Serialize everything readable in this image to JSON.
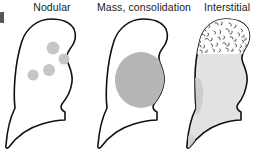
{
  "figure": {
    "name": "radiographic-lung-patterns",
    "background_color": "#ffffff",
    "outline_color": "#111111",
    "panel_count": 3
  },
  "panels": [
    {
      "id": "nodular",
      "label": "Nodular",
      "pattern": "nodular",
      "fill_color": "#ffffff",
      "lesion_color": "#c6c6c6",
      "description_icon": "lung-outline-icon",
      "lesions": [
        {
          "cx": 49,
          "cy": 34,
          "r": 6.5
        },
        {
          "cx": 60,
          "cy": 45,
          "r": 5.5
        },
        {
          "cx": 45,
          "cy": 56,
          "r": 6.0
        },
        {
          "cx": 29,
          "cy": 61,
          "r": 5.5
        }
      ]
    },
    {
      "id": "mass",
      "label": "Mass, consolidation",
      "pattern": "mass-consolidation",
      "fill_color": "#ffffff",
      "lesion_color": "#b6b6b6",
      "description_icon": "lung-outline-icon",
      "lesions": [
        {
          "cx": 45,
          "cy": 66,
          "rx": 26,
          "ry": 28
        }
      ]
    },
    {
      "id": "interstitial",
      "label": "Interstitial",
      "pattern": "interstitial",
      "fill_color": "#e2e2e2",
      "lesion_color": "#dcdcdc",
      "reticular_mark_color": "#3a3a3a",
      "description_icon": "lung-outline-icon",
      "lesions": []
    }
  ],
  "edge_marker": {
    "name": "cropped-edge-mark",
    "color": "#56565a"
  }
}
